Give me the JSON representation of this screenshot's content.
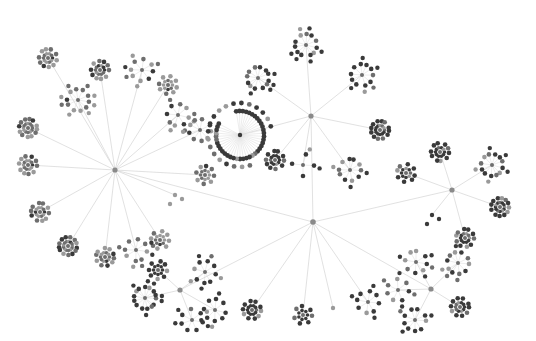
{
  "diagram": {
    "type": "radial-tree-network",
    "background": "#ffffff",
    "colors": {
      "edge": "#d4d4d4",
      "node_dark": "#3a3a3a",
      "node_mid": "#6e6e6e",
      "node_light": "#9a9a9a",
      "hub": "#8a8a8a"
    },
    "root": {
      "x": 313,
      "y": 222
    },
    "hubs": [
      {
        "id": "left",
        "x": 115,
        "y": 170,
        "tone": "light",
        "clusters": [
          [
            28,
            128,
            12,
            "ring"
          ],
          [
            78,
            100,
            10,
            "star"
          ],
          [
            48,
            58,
            10,
            "ring"
          ],
          [
            100,
            70,
            10,
            "ring"
          ],
          [
            142,
            70,
            8,
            "star"
          ],
          [
            168,
            85,
            8,
            "ring"
          ],
          [
            178,
            115,
            8,
            "star"
          ],
          [
            200,
            130,
            9,
            "star"
          ],
          [
            205,
            175,
            8,
            "ring"
          ],
          [
            175,
            195,
            6,
            "pair"
          ],
          [
            160,
            240,
            8,
            "ring"
          ],
          [
            136,
            250,
            8,
            "star"
          ],
          [
            105,
            257,
            10,
            "ring"
          ],
          [
            68,
            246,
            13,
            "ring"
          ],
          [
            40,
            212,
            10,
            "ring"
          ],
          [
            28,
            165,
            10,
            "ring"
          ]
        ]
      },
      {
        "id": "top",
        "x": 311,
        "y": 116,
        "tone": "dark",
        "clusters": [
          [
            306,
            45,
            11,
            "star"
          ],
          [
            258,
            78,
            12,
            "star"
          ],
          [
            240,
            135,
            20,
            "fan"
          ],
          [
            275,
            160,
            10,
            "ring"
          ],
          [
            303,
            165,
            4,
            "star"
          ],
          [
            350,
            170,
            10,
            "star"
          ],
          [
            380,
            130,
            12,
            "ring"
          ],
          [
            362,
            75,
            10,
            "star"
          ]
        ]
      },
      {
        "id": "right",
        "x": 452,
        "y": 190,
        "tone": "dark",
        "clusters": [
          [
            406,
            173,
            8,
            "ring"
          ],
          [
            440,
            152,
            10,
            "ring"
          ],
          [
            492,
            165,
            12,
            "star"
          ],
          [
            500,
            207,
            12,
            "ring"
          ],
          [
            465,
            238,
            10,
            "ring"
          ],
          [
            432,
            215,
            6,
            "pair"
          ]
        ]
      },
      {
        "id": "bottom-right",
        "x": 431,
        "y": 289,
        "tone": "dark",
        "clusters": [
          [
            416,
            262,
            8,
            "star"
          ],
          [
            458,
            263,
            10,
            "star"
          ],
          [
            460,
            307,
            10,
            "ring"
          ],
          [
            415,
            320,
            9,
            "star"
          ],
          [
            398,
            290,
            7,
            "star"
          ]
        ]
      },
      {
        "id": "bottom-left",
        "x": 180,
        "y": 290,
        "tone": "dark",
        "clusters": [
          [
            145,
            298,
            14,
            "star"
          ],
          [
            158,
            270,
            8,
            "ring"
          ],
          [
            205,
            272,
            8,
            "star"
          ],
          [
            215,
            310,
            8,
            "star"
          ],
          [
            192,
            320,
            7,
            "star"
          ]
        ]
      }
    ],
    "leaf_clusters_from_root": [
      [
        252,
        310,
        10,
        "ring"
      ],
      [
        303,
        315,
        7,
        "ring"
      ],
      [
        333,
        308,
        1,
        "single"
      ],
      [
        368,
        302,
        8,
        "star"
      ]
    ],
    "stats": {
      "hubs": 5,
      "clusters_visible": 44
    }
  }
}
